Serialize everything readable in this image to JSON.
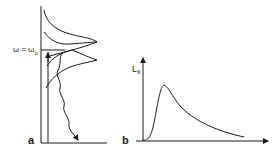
{
  "figure": {
    "panel_a": {
      "label": "a",
      "level_label": "ω = ω",
      "level_label_sub": "o"
    },
    "panel_b": {
      "label": "b",
      "y_axis_label": "L",
      "y_axis_label_sub": "x"
    },
    "colors": {
      "line": "#1a1a1a",
      "background": "#ffffff"
    }
  }
}
